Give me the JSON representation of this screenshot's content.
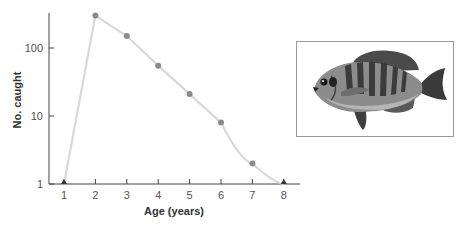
{
  "chart_data": {
    "type": "line",
    "title": "",
    "xlabel": "Age (years)",
    "ylabel": "No. caught",
    "yscale": "log",
    "ylim": [
      1,
      400
    ],
    "xlim": [
      0.5,
      8.5
    ],
    "x_ticks": [
      "1",
      "2",
      "3",
      "4",
      "5",
      "6",
      "7",
      "8"
    ],
    "y_ticks": [
      "1",
      "10",
      "100"
    ],
    "grid": false,
    "legend": null,
    "x": [
      1,
      2,
      3,
      4,
      5,
      6,
      7,
      8
    ],
    "series": [
      {
        "name": "No. caught",
        "values": [
          1,
          300,
          150,
          55,
          21,
          8,
          2,
          1
        ],
        "markers": [
          "triangle",
          "circle",
          "circle",
          "circle",
          "circle",
          "circle",
          "circle",
          "triangle"
        ]
      }
    ],
    "annotations": [
      "Illustration of a bluegill sunfish (inset image)"
    ]
  },
  "colors": {
    "line": "#d9d9d9",
    "marker": "#8a8a8a",
    "triangle": "#333333",
    "axis": "#444444"
  },
  "inset": {
    "description": "bluegill fish illustration"
  }
}
